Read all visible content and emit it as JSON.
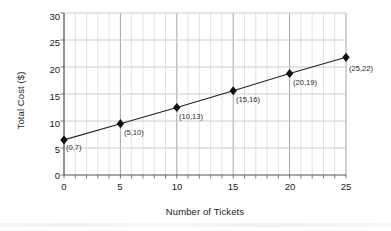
{
  "chart_data": {
    "type": "line",
    "title": "",
    "xlabel": "Number of Tickets",
    "ylabel": "Total Cost ($)",
    "xlim": [
      0,
      25
    ],
    "ylim": [
      0,
      30
    ],
    "xticks": [
      0,
      5,
      10,
      15,
      20,
      25
    ],
    "yticks": [
      0,
      5,
      10,
      15,
      20,
      25,
      30
    ],
    "x_minor_tick_step": 1,
    "grid": true,
    "grid_color": "#c8c8c8",
    "legend": "none",
    "marker": "diamond",
    "marker_color": "#111111",
    "line_color": "#222222",
    "x": [
      0,
      5,
      10,
      15,
      20,
      25
    ],
    "values": [
      7,
      10,
      13,
      16,
      19,
      22
    ],
    "plotted_values": [
      6.5,
      9.5,
      12.5,
      15.6,
      18.8,
      21.8
    ],
    "point_labels": [
      "(0,7)",
      "(5,10)",
      "(10,13)",
      "(15,16)",
      "(20,19)",
      "(25,22)"
    ]
  },
  "axes": {
    "y_tick_labels": [
      "30",
      "25",
      "20",
      "15",
      "10",
      "5",
      "0"
    ],
    "x_tick_labels": [
      "0",
      "5",
      "10",
      "15",
      "20",
      "25"
    ],
    "y_title": "Total Cost ($)",
    "x_title": "Number of Tickets"
  }
}
